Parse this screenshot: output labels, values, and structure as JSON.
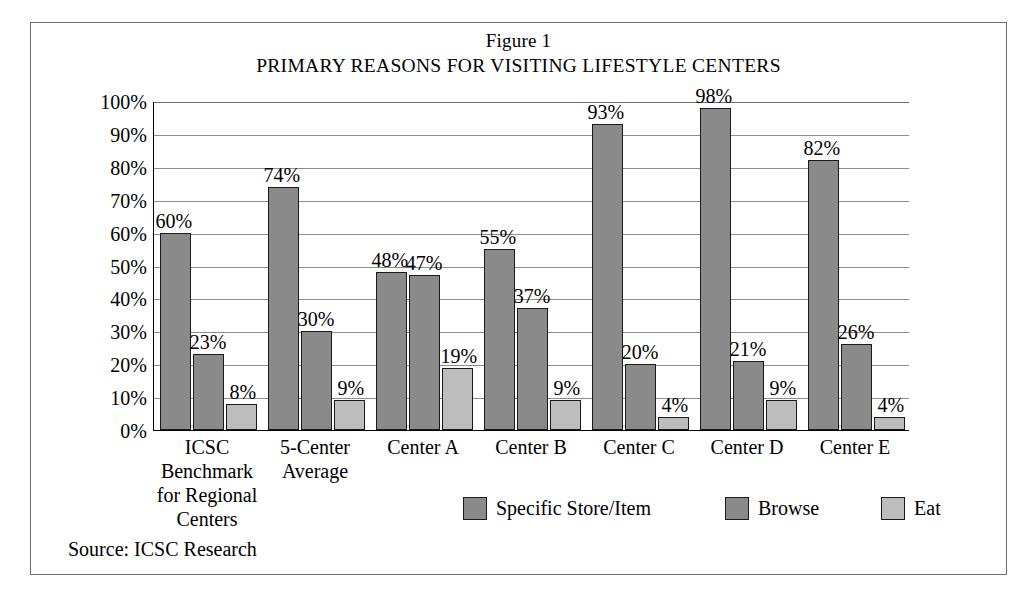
{
  "figure": {
    "number_label": "Figure 1",
    "title": "PRIMARY REASONS FOR VISITING LIFESTYLE CENTERS",
    "source_note": "Source: ICSC Research"
  },
  "chart_data": {
    "type": "bar",
    "title": "PRIMARY REASONS FOR VISITING LIFESTYLE CENTERS",
    "subtitle": "Figure 1",
    "xlabel": "",
    "ylabel": "",
    "ylim": [
      0,
      100
    ],
    "ytick_labels": [
      "100%",
      "90%",
      "80%",
      "70%",
      "60%",
      "50%",
      "40%",
      "30%",
      "20%",
      "10%",
      "0%"
    ],
    "ytick_values": [
      100,
      90,
      80,
      70,
      60,
      50,
      40,
      30,
      20,
      10,
      0
    ],
    "grid": true,
    "grid_axis": "y",
    "legend_position": "bottom-center",
    "unit": "%",
    "categories": [
      "ICSC\nBenchmark\nfor Regional\nCenters",
      "5-Center\nAverage",
      "Center A",
      "Center B",
      "Center C",
      "Center D",
      "Center E"
    ],
    "category_labels_flat": [
      "ICSC Benchmark for Regional Centers",
      "5-Center Average",
      "Center A",
      "Center B",
      "Center C",
      "Center D",
      "Center E"
    ],
    "series": [
      {
        "name": "Specific Store/Item",
        "color": "#8a8a8a",
        "values": [
          60,
          74,
          48,
          55,
          93,
          98,
          82
        ],
        "value_labels": [
          "60%",
          "74%",
          "48%",
          "55%",
          "93%",
          "98%",
          "82%"
        ]
      },
      {
        "name": "Browse",
        "color": "#8a8a8a",
        "values": [
          23,
          30,
          47,
          37,
          20,
          21,
          26
        ],
        "value_labels": [
          "23%",
          "30%",
          "47%",
          "37%",
          "20%",
          "21%",
          "26%"
        ]
      },
      {
        "name": "Eat",
        "color": "#bdbdbd",
        "values": [
          8,
          9,
          19,
          9,
          4,
          9,
          4
        ],
        "value_labels": [
          "8%",
          "9%",
          "19%",
          "9%",
          "4%",
          "9%",
          "4%"
        ]
      }
    ]
  },
  "legend": {
    "items": [
      {
        "label": "Specific Store/Item",
        "color": "#8a8a8a"
      },
      {
        "label": "Browse",
        "color": "#8a8a8a"
      },
      {
        "label": "Eat",
        "color": "#bdbdbd"
      }
    ]
  }
}
